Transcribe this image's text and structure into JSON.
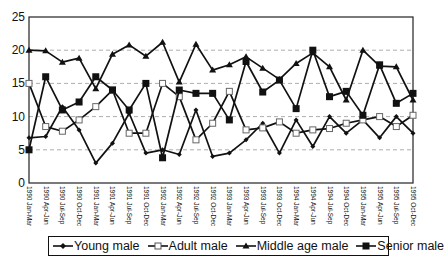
{
  "chart_data": {
    "type": "line",
    "title": "",
    "xlabel": "",
    "ylabel": "",
    "ylim": [
      0,
      25
    ],
    "yticks": [
      0,
      5,
      10,
      15,
      20,
      25
    ],
    "grid": "horizontal dashed",
    "legend_position": "bottom",
    "categories": [
      "1990 Jan-Mar",
      "1990 Apr-Jun",
      "1990 Jul-Sep",
      "1990 Oct-Dec",
      "1991 Jan-Mar",
      "1991 Apr-Jun",
      "1991 Jul-Sep",
      "1991 Oct-Dec",
      "1992 Jan-Mar",
      "1992 Apr-Jun",
      "1992 Jul-Sep",
      "1992 Oct-Dec",
      "1993 Jan-Mar",
      "1993 Apr-Jun",
      "1993 Jul-Sep",
      "1993 Oct-Dec",
      "1994 Jan-Mar",
      "1994 Apr-Jun",
      "1994 Jul-Sep",
      "1994 Oct-Dec",
      "1995 Jan-Mar",
      "1995 Apr-Jun",
      "1995 Jul-Sep",
      "1995 Oct-Dec"
    ],
    "series": [
      {
        "name": "Young male",
        "marker": "diamond",
        "values": [
          6.8,
          7,
          11.5,
          8,
          3,
          6,
          10.5,
          4.5,
          5,
          4.3,
          11,
          4,
          4.5,
          6.5,
          9,
          4.5,
          9.5,
          5.5,
          10,
          7.5,
          9.5,
          6.8,
          10,
          7.5
        ]
      },
      {
        "name": "Adult male",
        "marker": "open-square",
        "values": [
          15,
          8.5,
          7.8,
          9.5,
          11.5,
          14,
          7.5,
          7.5,
          15,
          13,
          6.5,
          9,
          13.8,
          8,
          8.3,
          9.2,
          7.5,
          8,
          8.2,
          9,
          9.5,
          10,
          8.5,
          10.2
        ]
      },
      {
        "name": "Middle age male",
        "marker": "triangle",
        "values": [
          20,
          19.9,
          18.2,
          18.8,
          14.2,
          19.4,
          20.8,
          19.1,
          21.2,
          15.2,
          20.9,
          17,
          17.8,
          19,
          17.3,
          15.6,
          18,
          19.6,
          17.5,
          12.5,
          20,
          17.6,
          17.5,
          12.5
        ]
      },
      {
        "name": "Senior male",
        "marker": "filled-square",
        "values": [
          5,
          16,
          11,
          12.2,
          16,
          14,
          11,
          15,
          3.8,
          14,
          13.5,
          13.5,
          9.5,
          18.3,
          13.7,
          15.5,
          11.2,
          20,
          13,
          13.8,
          10.2,
          17.8,
          12,
          13.5
        ]
      }
    ]
  },
  "legend": {
    "items": [
      "Young male",
      "Adult male",
      "Middle age male",
      "Senior male"
    ]
  }
}
